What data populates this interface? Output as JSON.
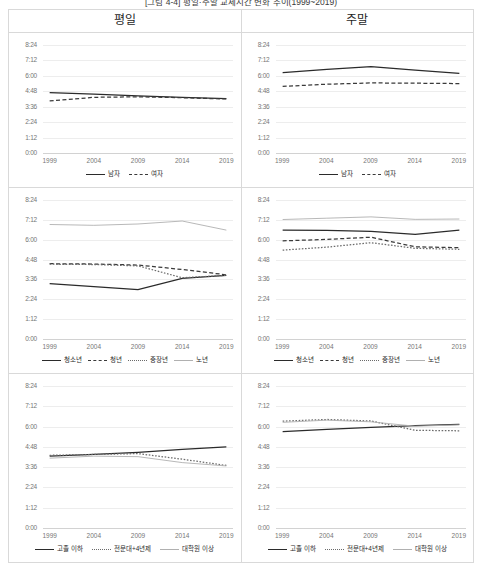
{
  "figure": {
    "title": "[그림 4-4] 평일·주말 교제시간 변화 추이(1999~2019)",
    "columns": [
      "평일",
      "주말"
    ]
  },
  "axis": {
    "y_ticks": [
      "8:24",
      "7:12",
      "6:00",
      "4:48",
      "3:36",
      "2:24",
      "1:12",
      "0:00"
    ],
    "x_ticks": [
      "1999",
      "2004",
      "2009",
      "2014",
      "2019"
    ],
    "ylim_hours": [
      0,
      8.4
    ],
    "xlim_years": [
      1999,
      2019
    ]
  },
  "colors": {
    "solid_dark": "#2b2b2b",
    "dashed_dark": "#3a3a3a",
    "dotted_mid": "#6b6b6b",
    "light_gray": "#b0b0b0",
    "gridline": "#ededed",
    "border": "#d9d9d9",
    "label": "#767676"
  },
  "chart_data": [
    {
      "id": "gender-weekday",
      "type": "line",
      "title": "평일",
      "panel": "성별 · 평일",
      "xlabel": "",
      "ylabel": "",
      "x": [
        1999,
        2004,
        2009,
        2014,
        2019
      ],
      "ylim": [
        0,
        8.4
      ],
      "grid": true,
      "legend_position": "bottom",
      "series": [
        {
          "name": "남자",
          "style": "solid",
          "color": "#2b2b2b",
          "values": [
            4.7,
            4.57,
            4.45,
            4.33,
            4.23
          ]
        },
        {
          "name": "여자",
          "style": "dashed",
          "color": "#3a3a3a",
          "values": [
            4.05,
            4.33,
            4.37,
            4.3,
            4.2
          ]
        }
      ]
    },
    {
      "id": "gender-weekend",
      "type": "line",
      "title": "주말",
      "panel": "성별 · 주말",
      "xlabel": "",
      "ylabel": "",
      "x": [
        1999,
        2004,
        2009,
        2014,
        2019
      ],
      "ylim": [
        0,
        8.4
      ],
      "grid": true,
      "legend_position": "bottom",
      "series": [
        {
          "name": "남자",
          "style": "solid",
          "color": "#2b2b2b",
          "values": [
            6.25,
            6.5,
            6.72,
            6.45,
            6.2
          ]
        },
        {
          "name": "여자",
          "style": "dashed",
          "color": "#3a3a3a",
          "values": [
            5.18,
            5.35,
            5.45,
            5.43,
            5.4
          ]
        }
      ]
    },
    {
      "id": "age-weekday",
      "type": "line",
      "title": "평일",
      "panel": "연령대 · 평일",
      "xlabel": "",
      "ylabel": "",
      "x": [
        1999,
        2004,
        2009,
        2014,
        2019
      ],
      "ylim": [
        0,
        8.4
      ],
      "grid": true,
      "legend_position": "bottom",
      "series": [
        {
          "name": "청소년",
          "style": "solid",
          "color": "#2b2b2b",
          "values": [
            3.35,
            3.17,
            2.98,
            3.67,
            3.85
          ]
        },
        {
          "name": "청년",
          "style": "dashed",
          "color": "#3a3a3a",
          "values": [
            4.55,
            4.53,
            4.47,
            4.2,
            3.88
          ]
        },
        {
          "name": "중장년",
          "style": "dotted",
          "color": "#6b6b6b",
          "values": [
            4.52,
            4.5,
            4.42,
            3.7,
            3.85
          ]
        },
        {
          "name": "노년",
          "style": "solid",
          "color": "#b0b0b0",
          "values": [
            6.92,
            6.87,
            6.95,
            7.13,
            6.58
          ]
        }
      ]
    },
    {
      "id": "age-weekend",
      "type": "line",
      "title": "주말",
      "panel": "연령대 · 주말",
      "xlabel": "",
      "ylabel": "",
      "x": [
        1999,
        2004,
        2009,
        2014,
        2019
      ],
      "ylim": [
        0,
        8.4
      ],
      "grid": true,
      "legend_position": "bottom",
      "series": [
        {
          "name": "청소년",
          "style": "solid",
          "color": "#2b2b2b",
          "values": [
            6.58,
            6.57,
            6.5,
            6.33,
            6.58
          ]
        },
        {
          "name": "청년",
          "style": "dashed",
          "color": "#3a3a3a",
          "values": [
            5.93,
            6.02,
            6.15,
            5.57,
            5.52
          ]
        },
        {
          "name": "중장년",
          "style": "dotted",
          "color": "#6b6b6b",
          "values": [
            5.37,
            5.55,
            5.82,
            5.48,
            5.42
          ]
        },
        {
          "name": "노년",
          "style": "solid",
          "color": "#b0b0b0",
          "values": [
            7.22,
            7.3,
            7.38,
            7.23,
            7.25
          ]
        }
      ]
    },
    {
      "id": "education-weekday",
      "type": "line",
      "title": "평일",
      "panel": "학력 · 평일",
      "xlabel": "",
      "ylabel": "",
      "x": [
        1999,
        2004,
        2009,
        2014,
        2019
      ],
      "ylim": [
        0,
        8.4
      ],
      "grid": true,
      "legend_position": "bottom",
      "series": [
        {
          "name": "고졸 이하",
          "style": "solid",
          "color": "#2b2b2b",
          "values": [
            4.25,
            4.35,
            4.48,
            4.65,
            4.8
          ]
        },
        {
          "name": "전문대+4년제",
          "style": "dotted",
          "color": "#6b6b6b",
          "values": [
            4.3,
            4.35,
            4.4,
            4.07,
            3.7
          ]
        },
        {
          "name": "대학원 이상",
          "style": "solid",
          "color": "#b0b0b0",
          "values": [
            4.13,
            4.25,
            4.22,
            3.87,
            3.67
          ]
        }
      ]
    },
    {
      "id": "education-weekend",
      "type": "line",
      "title": "주말",
      "panel": "학력 · 주말",
      "xlabel": "",
      "ylabel": "",
      "x": [
        1999,
        2004,
        2009,
        2014,
        2019
      ],
      "ylim": [
        0,
        8.4
      ],
      "grid": true,
      "legend_position": "bottom",
      "series": [
        {
          "name": "고졸 이하",
          "style": "solid",
          "color": "#2b2b2b",
          "values": [
            5.7,
            5.83,
            5.95,
            6.05,
            6.13
          ]
        },
        {
          "name": "전문대+4년제",
          "style": "dotted",
          "color": "#6b6b6b",
          "values": [
            6.32,
            6.42,
            6.33,
            5.78,
            5.75
          ]
        },
        {
          "name": "대학원 이상",
          "style": "solid",
          "color": "#b0b0b0",
          "values": [
            6.25,
            6.38,
            6.28,
            6.02,
            6.1
          ]
        }
      ]
    }
  ]
}
